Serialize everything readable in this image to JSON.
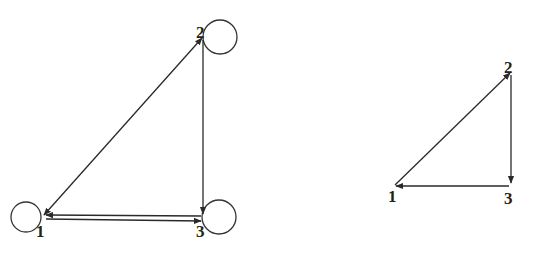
{
  "diagrams": [
    {
      "name": "graph-left",
      "nodes": [
        {
          "id": "1",
          "label": "1",
          "x": 42,
          "y": 218,
          "self_loop": true
        },
        {
          "id": "2",
          "label": "2",
          "x": 203,
          "y": 35,
          "self_loop": true
        },
        {
          "id": "3",
          "label": "3",
          "x": 202,
          "y": 218,
          "self_loop": true
        }
      ],
      "edges": [
        {
          "from": "1",
          "to": "2"
        },
        {
          "from": "2",
          "to": "1"
        },
        {
          "from": "2",
          "to": "3"
        },
        {
          "from": "1",
          "to": "3"
        },
        {
          "from": "3",
          "to": "1"
        },
        {
          "from": "1",
          "to": "1"
        },
        {
          "from": "2",
          "to": "2"
        },
        {
          "from": "3",
          "to": "3"
        }
      ]
    },
    {
      "name": "graph-right",
      "nodes": [
        {
          "id": "1",
          "label": "1",
          "x": 394,
          "y": 186,
          "self_loop": false
        },
        {
          "id": "2",
          "label": "2",
          "x": 511,
          "y": 72,
          "self_loop": false
        },
        {
          "id": "3",
          "label": "3",
          "x": 510,
          "y": 186,
          "self_loop": false
        }
      ],
      "edges": [
        {
          "from": "1",
          "to": "2"
        },
        {
          "from": "2",
          "to": "3"
        },
        {
          "from": "3",
          "to": "1"
        }
      ]
    }
  ],
  "labels": {
    "left": {
      "n1": "1",
      "n2": "2",
      "n3": "3"
    },
    "right": {
      "n1": "1",
      "n2": "2",
      "n3": "3"
    }
  },
  "colors": {
    "stroke": "#2a2a2a",
    "background": "#ffffff"
  }
}
